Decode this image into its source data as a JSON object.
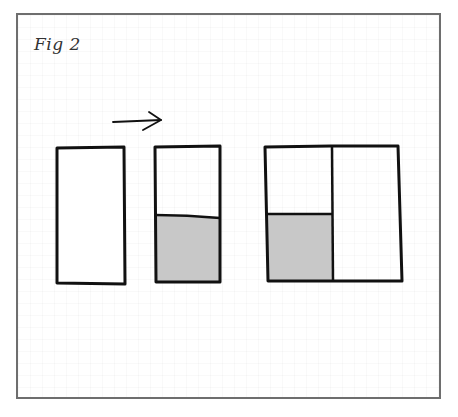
{
  "figure": {
    "title": "Fig 2",
    "colors": {
      "frame": "#6e6e6e",
      "stroke": "#111111",
      "shade": "#c8c8c8",
      "background": "#ffffff"
    },
    "arrow": {
      "direction": "right",
      "icon": "arrow-right-icon"
    },
    "shapes": [
      {
        "name": "rectangle-empty",
        "parts": [
          "unshaded"
        ]
      },
      {
        "name": "rectangle-partially-shaded",
        "parts": [
          "unshaded-top",
          "shaded-bottom"
        ]
      },
      {
        "name": "rectangle-combined",
        "parts": [
          "left-unshaded-top",
          "left-shaded-bottom",
          "right-unshaded"
        ]
      }
    ]
  }
}
